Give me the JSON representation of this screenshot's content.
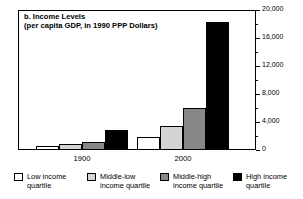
{
  "chart_data": {
    "type": "bar",
    "title": "b. Income Levels",
    "subtitle": "(per capita GDP, in 1990 PPP Dollars)",
    "xlabel": "",
    "ylabel": "",
    "ylim": [
      0,
      20000
    ],
    "ytick_labels": [
      "0",
      "4,000",
      "8,000",
      "12,000",
      "16,000",
      "20,000"
    ],
    "ytick_values": [
      0,
      4000,
      8000,
      12000,
      16000,
      20000
    ],
    "yminor_interval": 2000,
    "grid": false,
    "legend_position": "bottom",
    "categories": [
      "1900",
      "2000"
    ],
    "series": [
      {
        "name": "Low income quartile",
        "color": "#ffffff",
        "values": [
          600,
          1850
        ]
      },
      {
        "name": "Middle-low income quartile",
        "color": "#d4d4d4",
        "values": [
          800,
          3400
        ]
      },
      {
        "name": "Middle-high income quartile",
        "color": "#878787",
        "values": [
          1200,
          6000
        ]
      },
      {
        "name": "High income quartile",
        "color": "#000000",
        "values": [
          2800,
          18300
        ]
      }
    ]
  },
  "legend": {
    "items": [
      {
        "label": "Low income\nquartile"
      },
      {
        "label": "Middle-low\nincome quartile"
      },
      {
        "label": "Middle-high\nincome quartile"
      },
      {
        "label": "High income\nquartile"
      }
    ]
  },
  "colors": {
    "axis": "#000000",
    "background": "#ffffff",
    "low": "#ffffff",
    "middle_low": "#d4d4d4",
    "middle_high": "#878787",
    "high": "#000000"
  }
}
